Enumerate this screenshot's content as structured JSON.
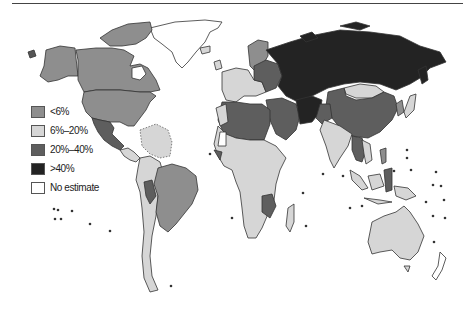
{
  "figure": {
    "type": "choropleth world map",
    "top_rule": true
  },
  "legend": {
    "items": [
      {
        "label": "<6%",
        "color": "#8e8e8e"
      },
      {
        "label": "6%–20%",
        "color": "#d6d6d6"
      },
      {
        "label": "20%–40%",
        "color": "#5e5e5e"
      },
      {
        "label": ">40%",
        "color": "#232323"
      },
      {
        "label": "No estimate",
        "color": "#ffffff"
      }
    ]
  },
  "map_data": {
    "classes": [
      "<6%",
      "6%–20%",
      "20%–40%",
      ">40%",
      "No estimate"
    ],
    "regions": [
      {
        "region": "Canada",
        "class": "<6%"
      },
      {
        "region": "United States",
        "class": "<6%"
      },
      {
        "region": "Alaska",
        "class": "<6%"
      },
      {
        "region": "Greenland",
        "class": "No estimate"
      },
      {
        "region": "Mexico",
        "class": "20%–40%"
      },
      {
        "region": "Central America & Caribbean",
        "class": "6%–20%"
      },
      {
        "region": "Brazil",
        "class": "<6%"
      },
      {
        "region": "Andean South America",
        "class": "6%–20%"
      },
      {
        "region": "Southern Cone",
        "class": "6%–20%"
      },
      {
        "region": "Western Europe",
        "class": "6%–20%"
      },
      {
        "region": "Scandinavia",
        "class": "<6%"
      },
      {
        "region": "Eastern Europe",
        "class": "20%–40%"
      },
      {
        "region": "Russia / Central Asia",
        "class": ">40%"
      },
      {
        "region": "Mongolia",
        "class": "6%–20%"
      },
      {
        "region": "China",
        "class": "20%–40%"
      },
      {
        "region": "Middle East",
        "class": "20%–40%"
      },
      {
        "region": "Iran / Afghanistan",
        "class": ">40%"
      },
      {
        "region": "India",
        "class": "6%–20%"
      },
      {
        "region": "Southeast Asia",
        "class": "20%–40%"
      },
      {
        "region": "North Africa",
        "class": "20%–40%"
      },
      {
        "region": "Sub-Saharan Africa",
        "class": "6%–20%"
      },
      {
        "region": "East Africa (partial)",
        "class": "20%–40%"
      },
      {
        "region": "Australia",
        "class": "6%–20%"
      },
      {
        "region": "New Zealand",
        "class": "No estimate"
      },
      {
        "region": "Indonesia",
        "class": "6%–20%"
      }
    ]
  }
}
